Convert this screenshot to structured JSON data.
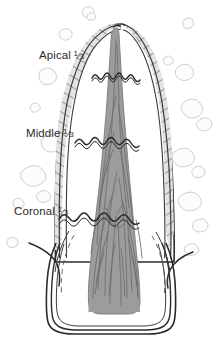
{
  "figure": {
    "type": "anatomical-line-diagram",
    "background_color": "#ffffff",
    "ink_color": "#2b2b2b"
  },
  "labels": [
    {
      "id": "apical",
      "name": "Apical",
      "fraction_numerator": "1",
      "fraction_slash": "⁄",
      "fraction_denominator": "3",
      "x": 39,
      "y": 50
    },
    {
      "id": "middle",
      "name": "Middle",
      "fraction_numerator": "1",
      "fraction_slash": "⁄",
      "fraction_denominator": "3",
      "x": 26,
      "y": 128
    },
    {
      "id": "coronal",
      "name": "Coronal",
      "fraction_numerator": "1",
      "fraction_slash": "⁄",
      "fraction_denominator": "3",
      "x": 14,
      "y": 206
    }
  ],
  "structures": {
    "root_outline": {
      "label": "root-outline",
      "stroke": "#2b2b2b",
      "fill": "#ffffff"
    },
    "dentin_hatching": {
      "label": "dentin-hatched-band",
      "stroke": "#555555",
      "fill": "#e0e0e0",
      "pattern": "diagonal-hatch"
    },
    "pulp": {
      "label": "pulp-chamber-and-canal",
      "fill": "#9a9a9a",
      "stroke": "#6b6b6b"
    },
    "vessels": {
      "label": "pulpal-vessels-and-nerves",
      "stroke": "#6f6f6f"
    },
    "crown": {
      "label": "crown-outline",
      "stroke": "#2b2b2b",
      "fill": "#ffffff"
    },
    "gingiva": {
      "label": "gingival-contour-lines",
      "stroke": "#2b2b2b"
    },
    "bone": {
      "label": "alveolar-bone-trabeculae",
      "stroke": "#c9c9c9",
      "fill": "#fbfbfb"
    },
    "dividers": {
      "label": "third-division-wavy-lines",
      "stroke": "#2b2b2b",
      "style": "wavy"
    }
  },
  "divider_lines": [
    {
      "id": "apical-middle-divider",
      "y": 73
    },
    {
      "id": "middle-coronal-divider",
      "y": 142
    },
    {
      "id": "coronal-crown-divider",
      "y": 218
    }
  ]
}
